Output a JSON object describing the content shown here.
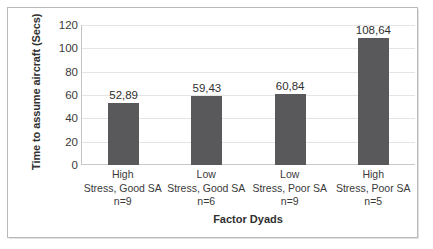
{
  "chart_data": {
    "type": "bar",
    "title": "",
    "xlabel": "Factor Dyads",
    "ylabel": "Time to assume aircraft (Secs)",
    "categories": [
      "High\nStress, Good SA\nn=9",
      "Low\nStress, Good SA\nn=6",
      "Low\nStress, Poor SA\nn=9",
      "High\nStress, Poor SA\nn=5"
    ],
    "category_lines": [
      [
        "High",
        "Stress, Good SA",
        "n=9"
      ],
      [
        "Low",
        "Stress, Good SA",
        "n=6"
      ],
      [
        "Low",
        "Stress, Poor SA",
        "n=9"
      ],
      [
        "High",
        "Stress, Poor SA",
        "n=5"
      ]
    ],
    "values": [
      52.89,
      59.43,
      60.84,
      108.64
    ],
    "value_labels": [
      "52,89",
      "59,43",
      "60,84",
      "108,64"
    ],
    "sample_sizes": [
      9,
      6,
      9,
      5
    ],
    "ylim": [
      0,
      120
    ],
    "ytick_values": [
      0,
      20,
      40,
      60,
      80,
      100,
      120
    ],
    "ytick_labels": [
      "0",
      "20",
      "40",
      "60",
      "80",
      "100",
      "120"
    ],
    "grid": true,
    "grid_axis": "y",
    "legend": false,
    "bar_color": "#59595b",
    "gridline_color": "#e4e4e4",
    "axis_color": "#c3c3c3"
  },
  "axis": {
    "y_title": "Time to assume aircraft (Secs)",
    "x_title": "Factor Dyads"
  },
  "ticks": {
    "y": [
      "120",
      "100",
      "80",
      "60",
      "40",
      "20",
      "0"
    ]
  },
  "bars": [
    {
      "label": "52,89",
      "value": 52.89,
      "cat1": "High",
      "cat2": "Stress, Good SA",
      "cat3": "n=9"
    },
    {
      "label": "59,43",
      "value": 59.43,
      "cat1": "Low",
      "cat2": "Stress, Good SA",
      "cat3": "n=6"
    },
    {
      "label": "60,84",
      "value": 60.84,
      "cat1": "Low",
      "cat2": "Stress, Poor SA",
      "cat3": "n=9"
    },
    {
      "label": "108,64",
      "value": 108.64,
      "cat1": "High",
      "cat2": "Stress, Poor SA",
      "cat3": "n=5"
    }
  ]
}
